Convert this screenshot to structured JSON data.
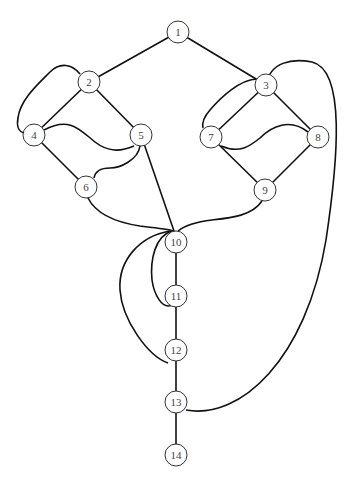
{
  "diagram": {
    "type": "graph",
    "nodes": [
      {
        "id": "1",
        "label": "1",
        "x": 178,
        "y": 32
      },
      {
        "id": "2",
        "label": "2",
        "x": 89,
        "y": 82
      },
      {
        "id": "3",
        "label": "3",
        "x": 266,
        "y": 85
      },
      {
        "id": "4",
        "label": "4",
        "x": 34,
        "y": 135
      },
      {
        "id": "5",
        "label": "5",
        "x": 141,
        "y": 135
      },
      {
        "id": "6",
        "label": "6",
        "x": 86,
        "y": 187
      },
      {
        "id": "7",
        "label": "7",
        "x": 211,
        "y": 137
      },
      {
        "id": "8",
        "label": "8",
        "x": 318,
        "y": 137
      },
      {
        "id": "9",
        "label": "9",
        "x": 265,
        "y": 190
      },
      {
        "id": "10",
        "label": "10",
        "x": 176,
        "y": 242
      },
      {
        "id": "11",
        "label": "11",
        "x": 176,
        "y": 296
      },
      {
        "id": "12",
        "label": "12",
        "x": 176,
        "y": 350
      },
      {
        "id": "13",
        "label": "13",
        "x": 176,
        "y": 402
      },
      {
        "id": "14",
        "label": "14",
        "x": 176,
        "y": 455
      }
    ],
    "edges": [
      [
        "1",
        "2"
      ],
      [
        "1",
        "3"
      ],
      [
        "2",
        "4"
      ],
      [
        "2",
        "5"
      ],
      [
        "2",
        "4",
        "curved"
      ],
      [
        "4",
        "5",
        "curved"
      ],
      [
        "4",
        "6"
      ],
      [
        "5",
        "6",
        "curved"
      ],
      [
        "5",
        "10"
      ],
      [
        "6",
        "10",
        "curved"
      ],
      [
        "3",
        "7"
      ],
      [
        "3",
        "8"
      ],
      [
        "3",
        "7",
        "curved"
      ],
      [
        "7",
        "8",
        "curved"
      ],
      [
        "7",
        "9"
      ],
      [
        "8",
        "9"
      ],
      [
        "9",
        "10",
        "curved"
      ],
      [
        "10",
        "11"
      ],
      [
        "10",
        "11",
        "curved"
      ],
      [
        "10",
        "12",
        "curved"
      ],
      [
        "11",
        "12"
      ],
      [
        "12",
        "13"
      ],
      [
        "13",
        "14"
      ],
      [
        "3",
        "13",
        "curved"
      ]
    ]
  }
}
